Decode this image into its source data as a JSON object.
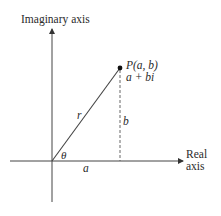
{
  "diagram": {
    "type": "complex-plane-polar-form",
    "labels": {
      "imaginary_axis": "Imaginary axis",
      "real_axis_line1": "Real",
      "real_axis_line2": "axis",
      "point": "P(a, b)",
      "complex_number": "a + bi",
      "radius": "r",
      "height": "b",
      "base": "a",
      "angle": "θ"
    },
    "colors": {
      "line": "#333333",
      "text": "#2a2a2a",
      "background": "#ffffff"
    }
  }
}
